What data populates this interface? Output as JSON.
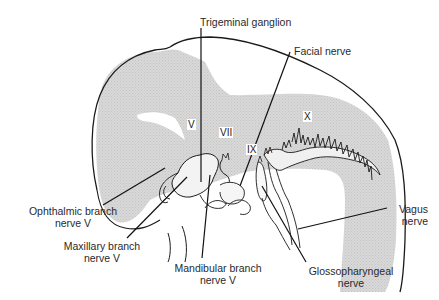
{
  "diagram": {
    "colors": {
      "outline": "#1a1a1a",
      "shading": "#d6d6d6",
      "background": "#ffffff",
      "text": "#2a2a2a"
    },
    "roman_labels": {
      "v": "V",
      "vii": "VII",
      "ix": "IX",
      "x": "X"
    },
    "labels": {
      "trigeminal_ganglion": "Trigeminal ganglion",
      "facial_nerve": "Facial nerve",
      "ophthalmic_1": "Ophthalmic branch",
      "ophthalmic_2": "nerve V",
      "maxillary_1": "Maxillary branch",
      "maxillary_2": "nerve V",
      "mandibular_1": "Mandibular branch",
      "mandibular_2": "nerve V",
      "glossopharyngeal_1": "Glossopharyngeal",
      "glossopharyngeal_2": "nerve",
      "vagus_1": "Vagus",
      "vagus_2": "nerve"
    }
  }
}
